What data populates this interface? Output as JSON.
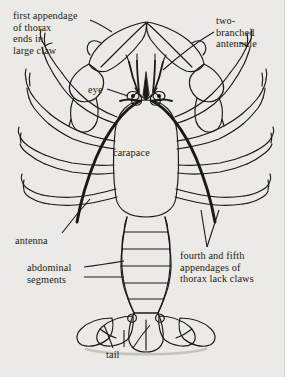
{
  "figure": {
    "background_color": "#eceae6",
    "ink_color": "#1c1a18",
    "labels": {
      "claw": "first appendage\nof thorax\nends in\nlarge claw",
      "antennule": "two-\nbranched\nantennule",
      "eye": "eye",
      "carapace": "carapace",
      "antenna": "antenna",
      "abdominal": "abdominal\nsegments",
      "fourth_fifth": "fourth and fifth\nappendages of\nthorax lack claws",
      "tail": "tail"
    }
  }
}
